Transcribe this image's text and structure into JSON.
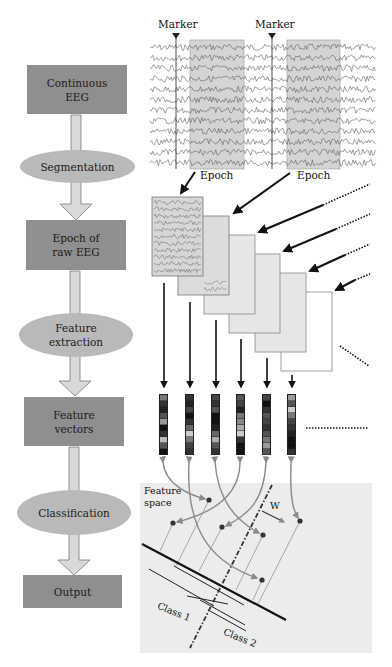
{
  "flowchart": {
    "steps": [
      {
        "type": "box",
        "label_line1": "Continuous",
        "label_line2": "EEG"
      },
      {
        "type": "ellipse",
        "label_line1": "Segmentation",
        "label_line2": ""
      },
      {
        "type": "box",
        "label_line1": "Epoch of",
        "label_line2": "raw EEG"
      },
      {
        "type": "ellipse",
        "label_line1": "Feature",
        "label_line2": "extraction"
      },
      {
        "type": "box",
        "label_line1": "Feature",
        "label_line2": "vectors"
      },
      {
        "type": "ellipse",
        "label_line1": "Classification",
        "label_line2": ""
      },
      {
        "type": "box",
        "label_line1": "Output",
        "label_line2": ""
      }
    ]
  },
  "eeg_panel": {
    "marker_labels": [
      "Marker",
      "Marker"
    ],
    "epoch_labels": [
      "Epoch",
      "Epoch"
    ],
    "channel_count": 12
  },
  "epochs_stack": {
    "count": 6
  },
  "feature_vectors": {
    "count": 6,
    "cells": [
      [
        "#777",
        "#333",
        "#222",
        "#555",
        "#999",
        "#111",
        "#333",
        "#bbb",
        "#555",
        "#111"
      ],
      [
        "#333",
        "#222",
        "#444",
        "#111",
        "#333",
        "#666",
        "#ccc",
        "#777",
        "#444",
        "#333"
      ],
      [
        "#444",
        "#333",
        "#555",
        "#111",
        "#111",
        "#222",
        "#666",
        "#aaa",
        "#555",
        "#333"
      ],
      [
        "#555",
        "#444",
        "#222",
        "#777",
        "#888",
        "#aaa",
        "#ccc",
        "#333",
        "#111",
        "#111"
      ],
      [
        "#444",
        "#111",
        "#333",
        "#555",
        "#444",
        "#333",
        "#555",
        "#777",
        "#999",
        "#555"
      ],
      [
        "#999",
        "#555",
        "#ccc",
        "#777",
        "#444",
        "#333",
        "#222",
        "#111",
        "#111",
        "#333"
      ]
    ]
  },
  "feature_space": {
    "title_line1": "Feature",
    "title_line2": "space",
    "weight_label": "W",
    "class_labels": [
      "Class 1",
      "Class 2"
    ]
  },
  "colors": {
    "box_fill": "#8f8f8f",
    "ellipse_fill": "#b9b9b9",
    "arrow_fill": "#d9d9d9",
    "epoch_shade": "#d4d4d4",
    "feature_space_bg": "#ececec",
    "curve_arrow": "#8a8a8a"
  }
}
